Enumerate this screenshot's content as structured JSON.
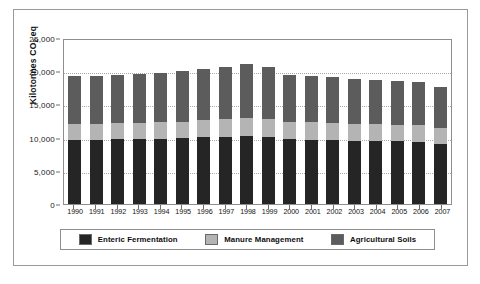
{
  "figure": {
    "y_axis_title": "Kilotonnes CO",
    "y_axis_title_sub": "2",
    "y_axis_title_suffix": " eq"
  },
  "legend": {
    "items": [
      {
        "label": "Enteric Fermentation",
        "color": "#252525",
        "swatch_name": "legend-swatch-enteric-fermentation"
      },
      {
        "label": "Manure Management",
        "color": "#b4b4b4",
        "swatch_name": "legend-swatch-manure-management"
      },
      {
        "label": "Agricultural Soils",
        "color": "#5c5c5c",
        "swatch_name": "legend-swatch-agricultural-soils"
      }
    ]
  },
  "chart_data": {
    "type": "bar",
    "stacked": true,
    "title": "",
    "xlabel": "",
    "ylabel": "Kilotonnes CO2 eq",
    "ylim": [
      0,
      25000
    ],
    "ytick_values": [
      0,
      5000,
      10000,
      15000,
      20000,
      25000
    ],
    "ytick_labels": [
      "0",
      "5,000",
      "10,000",
      "15,000",
      "20,000",
      "25,000"
    ],
    "grid": true,
    "grid_axis": "y",
    "legend_position": "bottom",
    "categories": [
      "1990",
      "1991",
      "1992",
      "1993",
      "1994",
      "1995",
      "1996",
      "1997",
      "1998",
      "1999",
      "2000",
      "2001",
      "2002",
      "2003",
      "2004",
      "2005",
      "2006",
      "2007"
    ],
    "series": [
      {
        "name": "Enteric Fermentation",
        "color": "#252525",
        "values": [
          9700,
          9700,
          9750,
          9800,
          9850,
          9900,
          10050,
          10150,
          10200,
          10100,
          9800,
          9700,
          9600,
          9500,
          9500,
          9450,
          9400,
          9000
        ]
      },
      {
        "name": "Manure Management",
        "color": "#b4b4b4",
        "values": [
          2300,
          2350,
          2400,
          2450,
          2500,
          2500,
          2650,
          2700,
          2750,
          2700,
          2600,
          2600,
          2550,
          2550,
          2500,
          2500,
          2450,
          2400
        ]
      },
      {
        "name": "Agricultural Soils",
        "color": "#5c5c5c",
        "values": [
          7250,
          7300,
          7300,
          7400,
          7450,
          7600,
          7650,
          7850,
          8100,
          7900,
          7100,
          7000,
          6950,
          6800,
          6700,
          6650,
          6600,
          6300
        ]
      }
    ],
    "totals": [
      19250,
      19350,
      19450,
      19650,
      19800,
      20000,
      20350,
      20700,
      21050,
      20700,
      19500,
      19300,
      19100,
      18850,
      18700,
      18600,
      18450,
      17700
    ]
  }
}
